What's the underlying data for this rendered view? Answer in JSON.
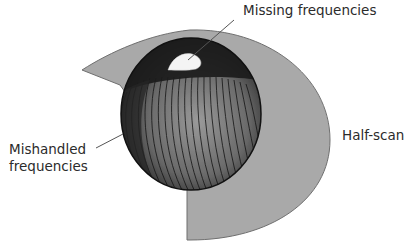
{
  "figure": {
    "type": "3d-frequency-coverage-diagram",
    "labels": {
      "missing": "Missing frequencies",
      "mishandled_line1": "Mishandled",
      "mishandled_line2": "frequencies",
      "halfscan": "Half-scan"
    },
    "colors": {
      "background": "#ffffff",
      "halfscan_fill": "#a9a9a9",
      "halfscan_edge": "#6f6f6f",
      "sphere_dark": "#1c1c1c",
      "sphere_mid": "#8a8a8a",
      "missing_region": "#f4f4f4",
      "leader_line": "#555555",
      "text": "#2b2b2b"
    }
  }
}
